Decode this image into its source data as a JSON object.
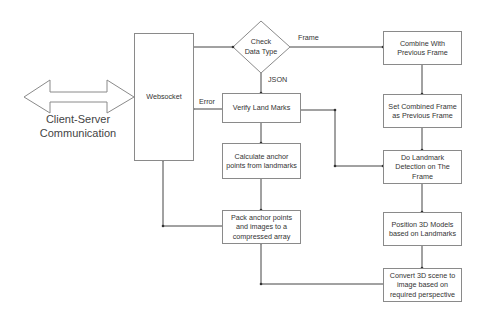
{
  "diagram": {
    "external": {
      "label_line1": "Client-Server",
      "label_line2": "Communication"
    },
    "nodes": {
      "websocket": "Websocket",
      "check_line1": "Check",
      "check_line2": "Data Type",
      "verify": "Verify Land Marks",
      "calculate": "Calculate anchor points from landmarks",
      "pack": "Pack anchor points and images to a compressed array",
      "combine": "Combine With Previous Frame",
      "set_combined": "Set Combined Frame as Previous Frame",
      "detect": "Do Landmark Detection on The Frame",
      "position": "Position 3D Models based on Landmarks",
      "convert": "Convert 3D scene to image based on required perspective"
    },
    "edge_labels": {
      "frame": "Frame",
      "json": "JSON",
      "error": "Error"
    },
    "edges": [
      {
        "from": "websocket",
        "to": "check"
      },
      {
        "from": "check",
        "to": "combine",
        "label": "Frame"
      },
      {
        "from": "check",
        "to": "verify",
        "label": "JSON"
      },
      {
        "from": "verify",
        "to": "websocket",
        "label": "Error"
      },
      {
        "from": "verify",
        "to": "calculate"
      },
      {
        "from": "verify",
        "to": "detect"
      },
      {
        "from": "calculate",
        "to": "pack"
      },
      {
        "from": "pack",
        "to": "websocket"
      },
      {
        "from": "combine",
        "to": "set_combined"
      },
      {
        "from": "set_combined",
        "to": "detect"
      },
      {
        "from": "detect",
        "to": "position"
      },
      {
        "from": "position",
        "to": "convert"
      },
      {
        "from": "convert",
        "to": "pack"
      }
    ]
  }
}
